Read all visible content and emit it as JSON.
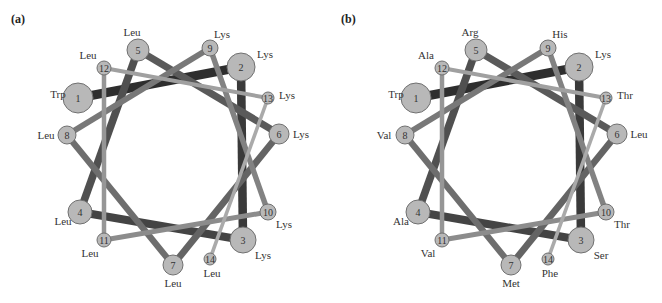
{
  "figure": {
    "panels": [
      {
        "label": "(a)",
        "residues": [
          "Trp",
          "Lys",
          "Lys",
          "Leu",
          "Leu",
          "Lys",
          "Leu",
          "Leu",
          "Lys",
          "Lys",
          "Leu",
          "Leu",
          "Lys",
          "Leu"
        ]
      },
      {
        "label": "(b)",
        "residues": [
          "Trp",
          "Lys",
          "Ser",
          "Ala",
          "Arg",
          "Leu",
          "Met",
          "Val",
          "His",
          "Thr",
          "Val",
          "Ala",
          "Thr",
          "Phe"
        ]
      }
    ],
    "nodes": [
      {
        "n": "1",
        "x": 78,
        "y": 98,
        "r": 15,
        "lx": -20,
        "ly": -4
      },
      {
        "n": "2",
        "x": 241,
        "y": 67,
        "r": 14,
        "lx": 24,
        "ly": -13
      },
      {
        "n": "3",
        "x": 243,
        "y": 240,
        "r": 13,
        "lx": 20,
        "ly": 15
      },
      {
        "n": "4",
        "x": 80,
        "y": 212,
        "r": 12,
        "lx": -17,
        "ly": 9
      },
      {
        "n": "5",
        "x": 138,
        "y": 50,
        "r": 11,
        "lx": -6,
        "ly": -18
      },
      {
        "n": "6",
        "x": 279,
        "y": 134,
        "r": 10,
        "lx": 22,
        "ly": 0
      },
      {
        "n": "7",
        "x": 173,
        "y": 265,
        "r": 10,
        "lx": 0,
        "ly": 18
      },
      {
        "n": "8",
        "x": 67,
        "y": 135,
        "r": 9,
        "lx": -21,
        "ly": 0
      },
      {
        "n": "9",
        "x": 210,
        "y": 48,
        "r": 8,
        "lx": 12,
        "ly": -14
      },
      {
        "n": "10",
        "x": 268,
        "y": 212,
        "r": 8,
        "lx": 16,
        "ly": 12
      },
      {
        "n": "11",
        "x": 104,
        "y": 240,
        "r": 7,
        "lx": -14,
        "ly": 13
      },
      {
        "n": "12",
        "x": 104,
        "y": 68,
        "r": 7,
        "lx": -16,
        "ly": -13
      },
      {
        "n": "13",
        "x": 268,
        "y": 98,
        "r": 6,
        "lx": 19,
        "ly": -3
      },
      {
        "n": "14",
        "x": 210,
        "y": 259,
        "r": 6,
        "lx": 2,
        "ly": 14
      }
    ],
    "colors": {
      "node_fill": "#b8b8b8",
      "node_stroke": "#707070",
      "edge_shades": [
        "#2e2e2e",
        "#3a3a3a",
        "#444444",
        "#505050",
        "#5a5a5a",
        "#646464",
        "#6e6e6e",
        "#787878",
        "#828282",
        "#8c8c8c",
        "#969696",
        "#a0a0a0",
        "#aaaaaa"
      ],
      "background": "#ffffff"
    }
  }
}
